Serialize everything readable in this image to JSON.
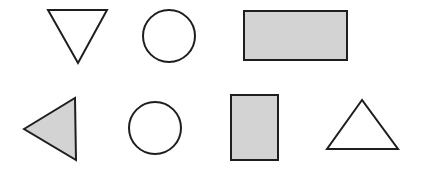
{
  "colors": {
    "background": "#ffffff",
    "stroke": "#1e1e1e",
    "shaded_fill": "#d3d3d3",
    "unshaded_fill": "#ffffff"
  },
  "stroke_width": 2,
  "rows": [
    {
      "name": "top-row",
      "shapes": [
        {
          "type": "triangle",
          "orientation": "down",
          "shaded": false,
          "points": "48,10 107,10 78,63"
        },
        {
          "type": "circle",
          "shaded": false,
          "cx": 169,
          "cy": 36,
          "r": 26
        },
        {
          "type": "rectangle",
          "shaded": true,
          "x": 244,
          "y": 11,
          "width": 103,
          "height": 49
        }
      ]
    },
    {
      "name": "bottom-row",
      "shapes": [
        {
          "type": "triangle",
          "orientation": "left",
          "shaded": true,
          "points": "24,129 75,98 76,160"
        },
        {
          "type": "circle",
          "shaded": false,
          "cx": 155,
          "cy": 128,
          "r": 26
        },
        {
          "type": "rectangle",
          "shaded": true,
          "x": 231,
          "y": 95,
          "width": 47,
          "height": 65
        },
        {
          "type": "triangle",
          "orientation": "up",
          "shaded": false,
          "points": "362,100 327,149 398,149"
        }
      ]
    }
  ]
}
